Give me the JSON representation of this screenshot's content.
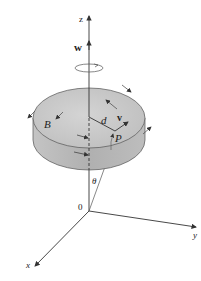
{
  "diagram": {
    "labels": {
      "z_axis": "z",
      "y_axis": "y",
      "x_axis": "x",
      "origin": "0",
      "angular_velocity": "w",
      "velocity": "v",
      "distance": "d",
      "point_p": "P",
      "point_b": "B",
      "angle": "θ"
    },
    "colors": {
      "disk_top": "#c8c8c8",
      "disk_side": "#b4b4b4",
      "axis": "#333333",
      "background": "#ffffff"
    }
  }
}
